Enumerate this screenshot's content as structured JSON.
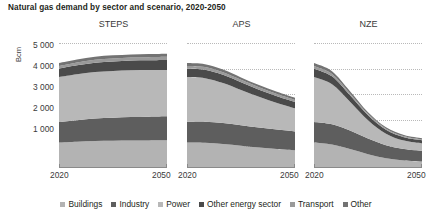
{
  "figure": {
    "title": "Natural gas demand by sector and scenario, 2020-2050",
    "ylabel": "Bcm"
  },
  "legend": {
    "position": "bottom-center",
    "items": [
      {
        "label": "Buildings",
        "color": "#b3b3b3"
      },
      {
        "label": "Industry",
        "color": "#5e5e5e"
      },
      {
        "label": "Power",
        "color": "#b8b8b8"
      },
      {
        "label": "Other energy sector",
        "color": "#4a4a4a"
      },
      {
        "label": "Transport",
        "color": "#9a9a9a"
      },
      {
        "label": "Other",
        "color": "#737373"
      }
    ]
  },
  "yaxis": {
    "ticks": [
      "0",
      "1 000",
      "2 000",
      "3 000",
      "4 000",
      "5 000"
    ],
    "min": 0,
    "max": 5000
  },
  "xaxis": {
    "ticks": [
      "2020",
      "2050"
    ],
    "min": 2020,
    "max": 2050
  },
  "panels": [
    {
      "title": "STEPS"
    },
    {
      "title": "APS"
    },
    {
      "title": "NZE"
    }
  ],
  "chart_data": {
    "type": "area",
    "title": "Natural gas demand by sector and scenario, 2020-2050",
    "xlabel": "",
    "ylabel": "Bcm",
    "ylim": [
      0,
      5000
    ],
    "xlim": [
      2020,
      2050
    ],
    "grid": "horizontal-dotted",
    "legend_position": "bottom-center",
    "stacked": true,
    "stack_order_bottom_to_top": [
      "Buildings",
      "Industry",
      "Power",
      "Other energy sector",
      "Transport",
      "Other"
    ],
    "x": [
      2020,
      2025,
      2030,
      2035,
      2040,
      2045,
      2050
    ],
    "panels": [
      {
        "name": "STEPS",
        "series": [
          {
            "name": "Buildings",
            "values": [
              1000,
              1030,
              1050,
              1060,
              1070,
              1075,
              1080
            ]
          },
          {
            "name": "Industry",
            "values": [
              800,
              840,
              880,
              900,
              920,
              930,
              940
            ]
          },
          {
            "name": "Power",
            "values": [
              1750,
              1790,
              1820,
              1830,
              1830,
              1820,
              1810
            ]
          },
          {
            "name": "Other energy sector",
            "values": [
              330,
              350,
              360,
              370,
              375,
              380,
              385
            ]
          },
          {
            "name": "Transport",
            "values": [
              105,
              110,
              115,
              120,
              122,
              125,
              128
            ]
          },
          {
            "name": "Other",
            "values": [
              115,
              115,
              118,
              120,
              120,
              120,
              120
            ]
          }
        ],
        "totals": [
          4100,
          4235,
          4343,
          4400,
          4437,
          4450,
          4463
        ]
      },
      {
        "name": "APS",
        "series": [
          {
            "name": "Buildings",
            "values": [
              1000,
              990,
              940,
              870,
              800,
              740,
              690
            ]
          },
          {
            "name": "Industry",
            "values": [
              800,
              820,
              820,
              800,
              780,
              760,
              740
            ]
          },
          {
            "name": "Power",
            "values": [
              1750,
              1700,
              1560,
              1380,
              1200,
              1040,
              900
            ]
          },
          {
            "name": "Other energy sector",
            "values": [
              330,
              330,
              320,
              300,
              280,
              265,
              250
            ]
          },
          {
            "name": "Transport",
            "values": [
              105,
              105,
              100,
              95,
              90,
              85,
              80
            ]
          },
          {
            "name": "Other",
            "values": [
              115,
              110,
              105,
              95,
              90,
              85,
              80
            ]
          }
        ],
        "totals": [
          4100,
          4055,
          3845,
          3540,
          3240,
          2975,
          2740
        ]
      },
      {
        "name": "NZE",
        "series": [
          {
            "name": "Buildings",
            "values": [
              1000,
              920,
              740,
              540,
              380,
              290,
              250
            ]
          },
          {
            "name": "Industry",
            "values": [
              800,
              790,
              720,
              610,
              510,
              450,
              420
            ]
          },
          {
            "name": "Power",
            "values": [
              1750,
              1560,
              1130,
              720,
              450,
              330,
              290
            ]
          },
          {
            "name": "Other energy sector",
            "values": [
              330,
              310,
              250,
              190,
              150,
              130,
              120
            ]
          },
          {
            "name": "Transport",
            "values": [
              105,
              95,
              75,
              55,
              45,
              40,
              38
            ]
          },
          {
            "name": "Other",
            "values": [
              115,
              105,
              85,
              65,
              55,
              48,
              45
            ]
          }
        ],
        "totals": [
          4100,
          3780,
          3000,
          2180,
          1590,
          1288,
          1163
        ]
      }
    ]
  }
}
